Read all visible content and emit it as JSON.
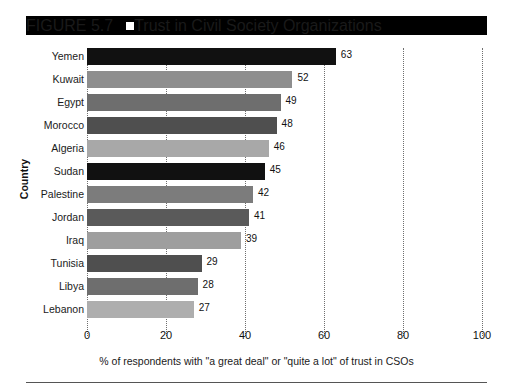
{
  "figure": {
    "number": "FIGURE 5.7",
    "marker": "filled-square-marker",
    "title": "Trust in Civil Society Organizations"
  },
  "chart_data": {
    "type": "bar",
    "orientation": "horizontal",
    "title": "Trust in Civil Society Organizations",
    "xlabel": "% of respondents with \"a great deal\" or \"quite a lot\" of trust in CSOs",
    "ylabel": "Country",
    "xlim": [
      0,
      100
    ],
    "xticks": [
      "0",
      "20",
      "40",
      "60",
      "80",
      "100"
    ],
    "grid": "vertical-dotted",
    "legend": "none",
    "categories": [
      "Yemen",
      "Kuwait",
      "Egypt",
      "Morocco",
      "Algeria",
      "Sudan",
      "Palestine",
      "Jordan",
      "Iraq",
      "Tunisia",
      "Libya",
      "Lebanon"
    ],
    "values": [
      63,
      52,
      49,
      48,
      46,
      45,
      42,
      41,
      39,
      29,
      28,
      27
    ],
    "bar_colors": [
      "#111111",
      "#8e8e8e",
      "#6e6e6e",
      "#4f4f4f",
      "#a8a8a8",
      "#111111",
      "#7c7c7c",
      "#5a5a5a",
      "#9e9e9e",
      "#4f4f4f",
      "#6e6e6e",
      "#aeaeae"
    ]
  }
}
